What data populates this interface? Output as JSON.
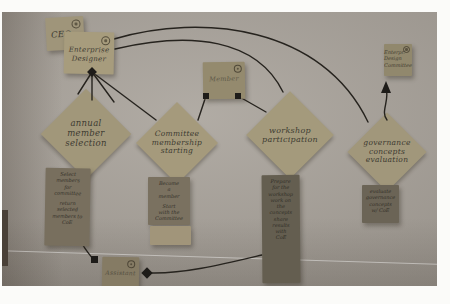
{
  "palette": {
    "wall": "#a8a29a",
    "note_tan": "#a39879",
    "note_dark": "#6b6456",
    "ink": "#3d3a31",
    "connector": "#1e1c19"
  },
  "actors": {
    "ceo": {
      "label": "CEO"
    },
    "enterprise_designer": {
      "lines": [
        "Enterprise",
        "Designer"
      ]
    },
    "member": {
      "label": "Member"
    },
    "enterprise_design_committee": {
      "lines": [
        "Enterpr.",
        "Design",
        "Committee"
      ]
    },
    "assistant": {
      "label": "Assistant"
    }
  },
  "activities": {
    "annual_member_selection": {
      "lines": [
        "annual",
        "member",
        "selection"
      ]
    },
    "committee_membership_starting": {
      "lines": [
        "Committee",
        "membership",
        "starting"
      ]
    },
    "workshop_participation": {
      "lines": [
        "workshop",
        "participation"
      ]
    },
    "governance_concepts_evaluation": {
      "lines": [
        "governance",
        "concepts",
        "evaluation"
      ]
    }
  },
  "tasks": {
    "select_members": {
      "lines": [
        "Select",
        "members",
        "for",
        "committee",
        "",
        "return",
        "selected",
        "members to",
        "CoE"
      ]
    },
    "become_member": {
      "lines": [
        "Become",
        "a",
        "member",
        "",
        "Start",
        "with the",
        "Committee"
      ]
    },
    "workshop_tasks": {
      "lines": [
        "Prepare",
        "for the",
        "workshop",
        "work on",
        "the",
        "concepts",
        "share",
        "results",
        "with",
        "CoE"
      ]
    },
    "governance_tasks": {
      "lines": [
        "evaluate",
        "governance",
        "concepts",
        "w/ CoE"
      ]
    }
  }
}
